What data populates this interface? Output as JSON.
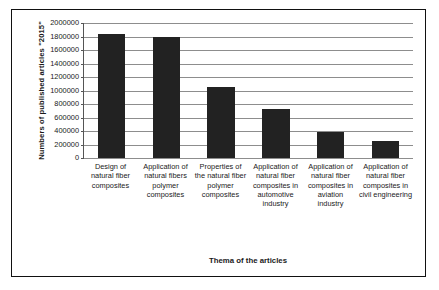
{
  "chart_data": {
    "type": "bar",
    "title": "",
    "xlabel": "Thema of the articles",
    "ylabel": "Numbers of published articles \"2015\"",
    "categories": [
      "Design of natural fiber composites",
      "Application of natural fibers polymer composites",
      "Properties of the natural fiber polymer composites",
      "Application of natural fiber composites in automotive industry",
      "Application of natural fiber composites in aviation industry",
      "Application of natural fiber composites in civil engineering"
    ],
    "values": [
      1840000,
      1790000,
      1050000,
      730000,
      380000,
      250000
    ],
    "ylim": [
      0,
      2000000
    ],
    "ytick_step": 200000,
    "yticks": [
      "2000000",
      "1800000",
      "1600000",
      "1400000",
      "1200000",
      "1000000",
      "800000",
      "600000",
      "400000",
      "200000",
      "0"
    ],
    "grid": true,
    "legend": false,
    "bar_color": "#222222",
    "grid_color": "#8d8d8d",
    "axis_color": "#555555",
    "frame_color": "#111111",
    "background": "#ffffff"
  },
  "figure": {
    "caption_fragment": ""
  }
}
